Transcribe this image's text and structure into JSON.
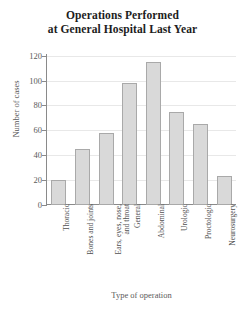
{
  "chart_data": {
    "type": "bar",
    "title": "Operations Performed at General Hospital Last Year",
    "title_lines": [
      "Operations Performed",
      "at General Hospital Last Year"
    ],
    "xlabel": "Type of operation",
    "ylabel": "Number of cases",
    "ylim": [
      0,
      120
    ],
    "ytick_labels": [
      "0",
      "20",
      "40",
      "60",
      "80",
      "100",
      "120"
    ],
    "ytick_values": [
      0,
      20,
      40,
      60,
      80,
      100,
      120
    ],
    "grid": true,
    "legend": null,
    "categories": [
      "Thoracic",
      "Bones and joints",
      "Ears, eyes, nose, and throat",
      "General",
      "Abdominal",
      "Urologic",
      "Proctologic",
      "Neurosurgery"
    ],
    "category_lines": [
      [
        "Thoracic"
      ],
      [
        "Bones and joints"
      ],
      [
        "Ears, eyes, nose,",
        "and throat"
      ],
      [
        "General"
      ],
      [
        "Abdominal"
      ],
      [
        "Urologic"
      ],
      [
        "Proctologic"
      ],
      [
        "Neurosurgery"
      ]
    ],
    "values": [
      20,
      45,
      58,
      98,
      115,
      75,
      65,
      23
    ],
    "bar_fill_color": "#d9d9d9",
    "bar_edge_color": "#a9a9a9",
    "grid_color": "#e8e8e8",
    "axis_color": "#8a8a8a",
    "background_color": "#ffffff"
  }
}
